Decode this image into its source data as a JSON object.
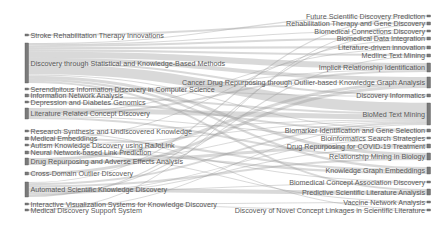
{
  "chart_data": {
    "type": "sankey",
    "title": "",
    "colors": {
      "node": "#7a7a7a",
      "node_stroke": "#555555",
      "link": "#9a9a9a",
      "label": "#5a5a5a",
      "background": "#ffffff"
    },
    "left_nodes": [
      {
        "id": "L0",
        "label": "Stroke Rehabilitation Therapy Innovations",
        "y": 34,
        "h": 2
      },
      {
        "id": "L1",
        "label": "Discovery through Statistical and Knowledge-Based Methods",
        "y": 43,
        "h": 40
      },
      {
        "id": "L2",
        "label": "Serendipitous Information Discovery in Computer Science",
        "y": 88,
        "h": 2
      },
      {
        "id": "L3",
        "label": "Information Network Analysis",
        "y": 94,
        "h": 3
      },
      {
        "id": "L4",
        "label": "Depression and Diabetes Genomics",
        "y": 101,
        "h": 2
      },
      {
        "id": "L5",
        "label": "Literature Related Concept Discovery",
        "y": 108,
        "h": 11
      },
      {
        "id": "L6",
        "label": "Research Synthesis and Undiscovered Knowledge",
        "y": 130,
        "h": 2
      },
      {
        "id": "L7",
        "label": "Medical Embeddings",
        "y": 137,
        "h": 3
      },
      {
        "id": "L8",
        "label": "Autism Knowledge Discovery using RaJoLink",
        "y": 144,
        "h": 2
      },
      {
        "id": "L9",
        "label": "Neural Network-based Link Prediction",
        "y": 151,
        "h": 3
      },
      {
        "id": "L10",
        "label": "Drug Repurposing and Adverse Effects Analysis",
        "y": 158,
        "h": 7
      },
      {
        "id": "L11",
        "label": "Cross-Domain Outlier Discovery",
        "y": 172,
        "h": 3
      },
      {
        "id": "L12",
        "label": "Automated Scientific Knowledge Discovery",
        "y": 182,
        "h": 15
      },
      {
        "id": "L13",
        "label": "Interactive Visualization Systems for Knowledge Discovery",
        "y": 203,
        "h": 2
      },
      {
        "id": "L14",
        "label": "Medical Discovery Support System",
        "y": 209,
        "h": 2
      }
    ],
    "right_nodes": [
      {
        "id": "R0",
        "label": "Future Scientific Discovery Prediction",
        "y": 15,
        "h": 2
      },
      {
        "id": "R1",
        "label": "Rehabilitation Therapy and Gene Discovery",
        "y": 22,
        "h": 3
      },
      {
        "id": "R2",
        "label": "Biomedical Connections Discovery",
        "y": 30,
        "h": 2
      },
      {
        "id": "R3",
        "label": "Biomedical Data Integration",
        "y": 37,
        "h": 3
      },
      {
        "id": "R4",
        "label": "Literature-driven innovation",
        "y": 46,
        "h": 3
      },
      {
        "id": "R5",
        "label": "Medline Text Mining",
        "y": 54,
        "h": 3
      },
      {
        "id": "R6",
        "label": "Implicit Relationship Identification",
        "y": 63,
        "h": 9
      },
      {
        "id": "R7",
        "label": "Cancer Drug Repurposing through Outlier-based Knowledge Graph Analysis",
        "y": 77,
        "h": 11
      },
      {
        "id": "R8",
        "label": "Discovery Informatics",
        "y": 94,
        "h": 3
      },
      {
        "id": "R9",
        "label": "BioMed Text Mining",
        "y": 103,
        "h": 22
      },
      {
        "id": "R10",
        "label": "Biomarker Identification and Gene Selection",
        "y": 129,
        "h": 3
      },
      {
        "id": "R11",
        "label": "Bioinformatics Search Strategies",
        "y": 137,
        "h": 2
      },
      {
        "id": "R12",
        "label": "Drug Repurposing for COVID-19 Treatment",
        "y": 144,
        "h": 4
      },
      {
        "id": "R13",
        "label": "Relationship Mining in Biology",
        "y": 153,
        "h": 7
      },
      {
        "id": "R14",
        "label": "Knowledge Graph Embeddings",
        "y": 167,
        "h": 7
      },
      {
        "id": "R15",
        "label": "Biomedical Concept Association Discovery",
        "y": 181,
        "h": 2
      },
      {
        "id": "R16",
        "label": "Predictive Scientific Literature Analysis",
        "y": 189,
        "h": 6
      },
      {
        "id": "R17",
        "label": "Vaccine Network Analysis",
        "y": 201,
        "h": 2
      },
      {
        "id": "R18",
        "label": "Discovery of Novel Concept Linkages in Scientific Literature",
        "y": 209,
        "h": 2
      }
    ],
    "links": [
      [
        "L0",
        "R1",
        2
      ],
      [
        "L1",
        "R0",
        1
      ],
      [
        "L1",
        "R2",
        1
      ],
      [
        "L1",
        "R3",
        2
      ],
      [
        "L1",
        "R4",
        2
      ],
      [
        "L1",
        "R5",
        2
      ],
      [
        "L1",
        "R6",
        6
      ],
      [
        "L1",
        "R7",
        4
      ],
      [
        "L1",
        "R8",
        2
      ],
      [
        "L1",
        "R9",
        10
      ],
      [
        "L1",
        "R10",
        1
      ],
      [
        "L1",
        "R13",
        3
      ],
      [
        "L1",
        "R14",
        2
      ],
      [
        "L1",
        "R16",
        2
      ],
      [
        "L2",
        "R8",
        1
      ],
      [
        "L2",
        "R7",
        1
      ],
      [
        "L3",
        "R6",
        1
      ],
      [
        "L3",
        "R9",
        2
      ],
      [
        "L4",
        "R10",
        2
      ],
      [
        "L5",
        "R9",
        5
      ],
      [
        "L5",
        "R4",
        1
      ],
      [
        "L5",
        "R6",
        2
      ],
      [
        "L5",
        "R11",
        1
      ],
      [
        "L5",
        "R13",
        2
      ],
      [
        "L6",
        "R9",
        1
      ],
      [
        "L6",
        "R18",
        1
      ],
      [
        "L7",
        "R14",
        2
      ],
      [
        "L7",
        "R3",
        1
      ],
      [
        "L8",
        "R9",
        1
      ],
      [
        "L8",
        "R15",
        1
      ],
      [
        "L9",
        "R14",
        2
      ],
      [
        "L9",
        "R17",
        1
      ],
      [
        "L10",
        "R7",
        3
      ],
      [
        "L10",
        "R12",
        3
      ],
      [
        "L10",
        "R9",
        1
      ],
      [
        "L11",
        "R7",
        3
      ],
      [
        "L12",
        "R0",
        1
      ],
      [
        "L12",
        "R9",
        2
      ],
      [
        "L12",
        "R13",
        2
      ],
      [
        "L12",
        "R16",
        4
      ],
      [
        "L12",
        "R15",
        1
      ],
      [
        "L12",
        "R11",
        1
      ],
      [
        "L12",
        "R12",
        1
      ],
      [
        "L12",
        "R5",
        1
      ],
      [
        "L12",
        "R2",
        1
      ],
      [
        "L13",
        "R18",
        1
      ],
      [
        "L13",
        "R17",
        1
      ],
      [
        "L14",
        "R9",
        1
      ],
      [
        "L14",
        "R1",
        1
      ]
    ]
  }
}
